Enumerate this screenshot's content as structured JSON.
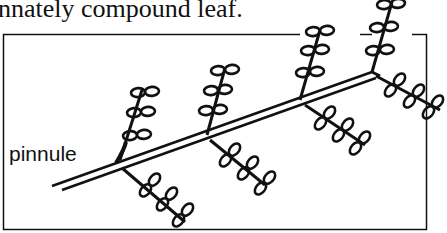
{
  "caption": "nnately compound leaf.",
  "labels": {
    "pinnule": "pinnule"
  },
  "figure": {
    "stroke_color": "#111111",
    "background": "#ffffff"
  }
}
